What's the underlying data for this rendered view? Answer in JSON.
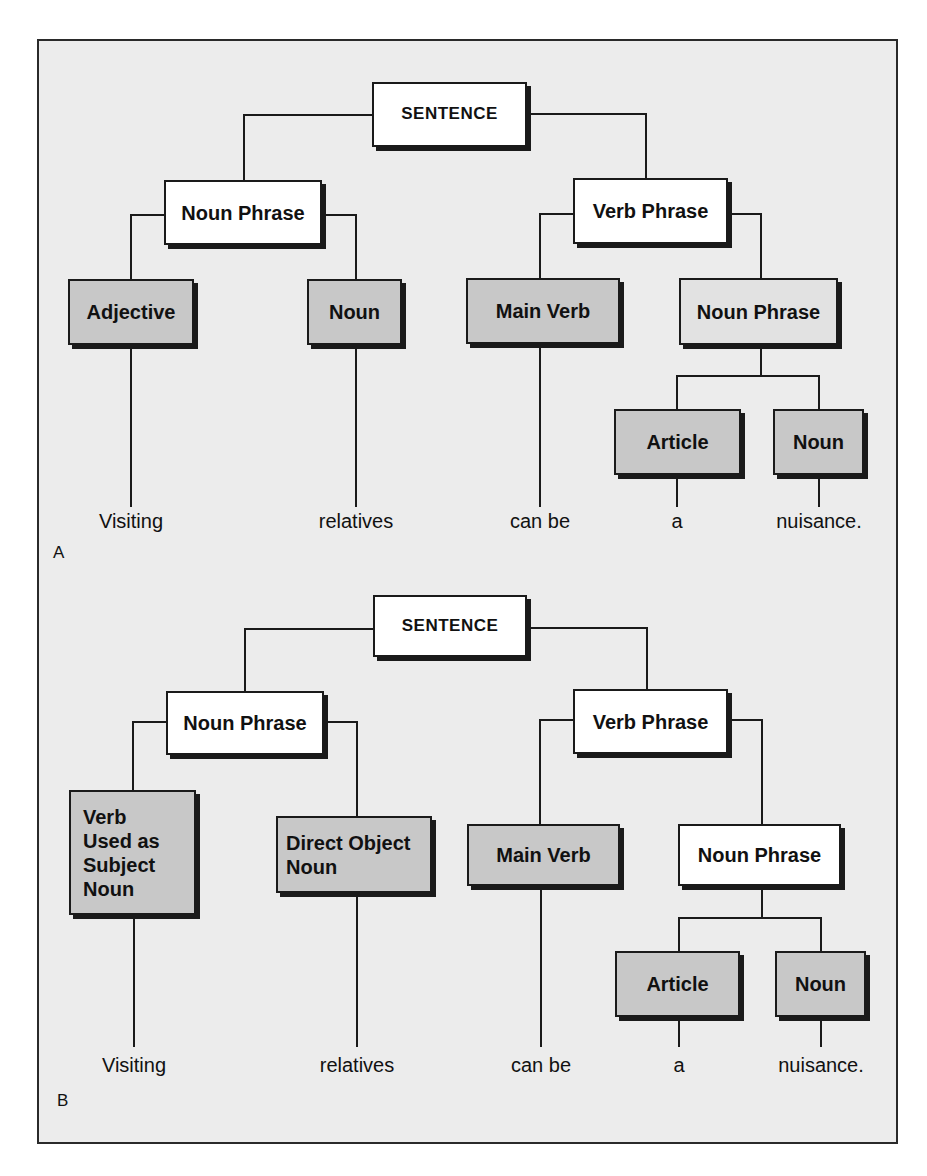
{
  "diagram": {
    "colors": {
      "background": "#ececec",
      "white_box": "#ffffff",
      "dark_box": "#c8c8c8",
      "light_box": "#e2e2e2",
      "ink": "#1a1a1a"
    },
    "panel_a": {
      "label": "A",
      "nodes": {
        "sentence": "SENTENCE",
        "noun_phrase": "Noun Phrase",
        "verb_phrase": "Verb Phrase",
        "adjective": "Adjective",
        "noun": "Noun",
        "main_verb": "Main Verb",
        "object_noun_phrase": "Noun Phrase",
        "article": "Article",
        "object_noun": "Noun"
      },
      "words": [
        "Visiting",
        "relatives",
        "can be",
        "a",
        "nuisance."
      ]
    },
    "panel_b": {
      "label": "B",
      "nodes": {
        "sentence": "SENTENCE",
        "noun_phrase": "Noun Phrase",
        "verb_phrase": "Verb Phrase",
        "subject_noun_lines": [
          "Verb",
          "Used as",
          "Subject",
          "Noun"
        ],
        "direct_object_lines": [
          "Direct Object",
          "Noun"
        ],
        "main_verb": "Main Verb",
        "object_noun_phrase": "Noun Phrase",
        "article": "Article",
        "object_noun": "Noun"
      },
      "words": [
        "Visiting",
        "relatives",
        "can be",
        "a",
        "nuisance."
      ]
    }
  }
}
